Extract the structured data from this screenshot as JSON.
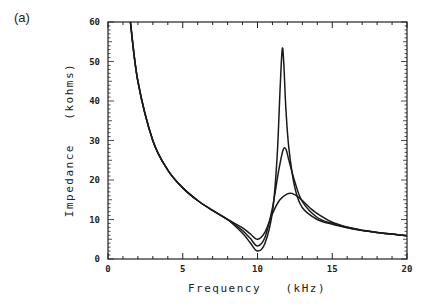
{
  "panel_label": "(a)",
  "chart_data": {
    "type": "line",
    "title": "",
    "xlabel": "Frequency   (kHz)",
    "ylabel": "Impedance   (kohms)",
    "xlim": [
      0,
      20
    ],
    "ylim": [
      0,
      60
    ],
    "xticks": [
      0,
      5,
      10,
      15,
      20
    ],
    "xtick_labels": [
      "0",
      "5",
      "10",
      "15",
      "20"
    ],
    "yticks": [
      0,
      10,
      20,
      30,
      40,
      50,
      60
    ],
    "ytick_labels": [
      "0",
      "10",
      "20",
      "30",
      "40",
      "50",
      "60"
    ],
    "grid": false,
    "legend": null,
    "series": [
      {
        "name": "curve-high-Q",
        "x": [
          1.5,
          2,
          3,
          4,
          5,
          6,
          7,
          8,
          9,
          9.5,
          10,
          10.5,
          11,
          11.3,
          11.5,
          11.65,
          11.75,
          11.9,
          12.1,
          12.5,
          13,
          14,
          15,
          16,
          17,
          18,
          19,
          20
        ],
        "y": [
          60,
          45,
          30,
          22.5,
          18,
          14.8,
          12.3,
          10,
          6.5,
          4.2,
          2,
          4,
          12,
          25,
          42,
          53,
          50,
          38,
          28,
          18,
          13,
          10,
          8.8,
          7.9,
          7.2,
          6.7,
          6.3,
          5.9
        ]
      },
      {
        "name": "curve-mid-Q",
        "x": [
          1.5,
          2,
          3,
          4,
          5,
          6,
          7,
          8,
          9,
          9.5,
          10,
          10.5,
          11,
          11.4,
          11.7,
          11.9,
          12.1,
          12.5,
          13,
          14,
          15,
          16,
          17,
          18,
          19,
          20
        ],
        "y": [
          60,
          45,
          30,
          22.5,
          18,
          14.8,
          12.3,
          10,
          7.2,
          5.3,
          3.3,
          5.5,
          13,
          22,
          27.5,
          27.8,
          25,
          19.5,
          14.5,
          10.5,
          9,
          8,
          7.3,
          6.7,
          6.3,
          5.9
        ]
      },
      {
        "name": "curve-low-Q",
        "x": [
          1.5,
          2,
          3,
          4,
          5,
          6,
          7,
          8,
          9,
          9.5,
          10,
          10.5,
          11,
          11.5,
          12,
          12.3,
          12.8,
          13.5,
          14,
          15,
          16,
          17,
          18,
          19,
          20
        ],
        "y": [
          60,
          45,
          30,
          22.5,
          18,
          14.8,
          12.3,
          10,
          7.9,
          6.4,
          5,
          6.8,
          11.5,
          15,
          16.5,
          16.6,
          15.5,
          13,
          11.5,
          9.3,
          8.1,
          7.3,
          6.7,
          6.3,
          5.9
        ]
      }
    ]
  }
}
